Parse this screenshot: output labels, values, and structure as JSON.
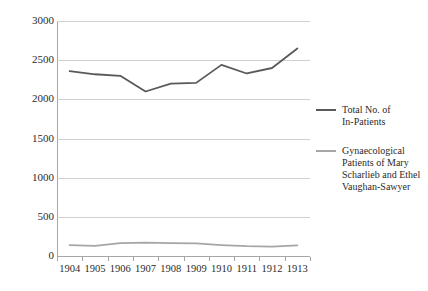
{
  "chart_data": {
    "type": "line",
    "title": "",
    "xlabel": "",
    "ylabel": "",
    "x": [
      "1904",
      "1905",
      "1906",
      "1907",
      "1908",
      "1909",
      "1910",
      "1911",
      "1912",
      "1913"
    ],
    "categories": [
      "1904",
      "1905",
      "1906",
      "1907",
      "1908",
      "1909",
      "1910",
      "1911",
      "1912",
      "1913"
    ],
    "ylim": [
      0,
      3000
    ],
    "yticks": [
      "0",
      "500",
      "1000",
      "1500",
      "2000",
      "2500",
      "3000"
    ],
    "ytick_values": [
      0,
      500,
      1000,
      1500,
      2000,
      2500,
      3000
    ],
    "grid": true,
    "legend_position": "right",
    "series": [
      {
        "name": "Total No. of In-Patients",
        "legend_label_line1": "Total No. of",
        "legend_label_line2": "In-Patients",
        "color": "#595959",
        "values": [
          2360,
          2320,
          2300,
          2100,
          2200,
          2210,
          2440,
          2330,
          2400,
          2650
        ]
      },
      {
        "name": "Gynaecological Patients of Mary Scharlieb and Ethel Vaughan-Sawyer",
        "legend_label_line1": "Gynaecological",
        "legend_label_line2": "Patients of Mary",
        "legend_label_line3": "Scharlieb and Ethel",
        "legend_label_line4": "Vaughan-Sawyer",
        "color": "#a6a6a6",
        "values": [
          140,
          130,
          165,
          170,
          165,
          160,
          140,
          125,
          120,
          135
        ]
      }
    ]
  },
  "colors": {
    "background": "#ffffff",
    "gridline": "#d0d0d0",
    "axis": "#a6a6a6",
    "text": "#2b2b2b",
    "series_primary": "#595959",
    "series_secondary": "#a6a6a6"
  }
}
